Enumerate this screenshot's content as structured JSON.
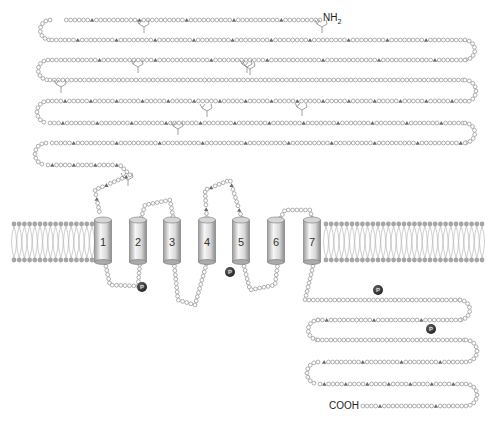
{
  "diagram": {
    "terminals": {
      "n_terminus": "NH",
      "n_sub": "2",
      "c_terminus": "COOH"
    },
    "helices": [
      {
        "label": "1",
        "x": 103
      },
      {
        "label": "2",
        "x": 138
      },
      {
        "label": "3",
        "x": 172
      },
      {
        "label": "4",
        "x": 207
      },
      {
        "label": "5",
        "x": 241
      },
      {
        "label": "6",
        "x": 276
      },
      {
        "label": "7",
        "x": 312
      }
    ],
    "phosphorylation_label": "P",
    "phosphorylation_sites": [
      {
        "x": 142,
        "y": 287
      },
      {
        "x": 230,
        "y": 272
      },
      {
        "x": 378,
        "y": 290
      },
      {
        "x": 431,
        "y": 329
      }
    ],
    "glycosylation_sites": [
      {
        "x": 144,
        "y": 33
      },
      {
        "x": 322,
        "y": 33
      },
      {
        "x": 138,
        "y": 73
      },
      {
        "x": 247,
        "y": 73
      },
      {
        "x": 250,
        "y": 75
      },
      {
        "x": 61,
        "y": 93
      },
      {
        "x": 207,
        "y": 117
      },
      {
        "x": 302,
        "y": 116
      },
      {
        "x": 178,
        "y": 135
      },
      {
        "x": 128,
        "y": 186
      }
    ],
    "membrane": {
      "top_y": 224,
      "bottom_y": 260,
      "left_x": 14,
      "right_x": 483
    },
    "colors": {
      "bead": "#9a9a9a",
      "triangle": "#6a6a6a",
      "helix_light": "#f4f4f4",
      "helix_dark": "#a8a8a8",
      "phospho": "#3a3a3a",
      "lipid": "#a6a6a6"
    }
  }
}
